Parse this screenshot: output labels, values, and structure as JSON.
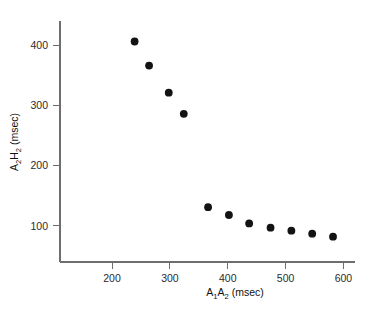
{
  "chart_data": {
    "type": "scatter",
    "title": "",
    "xlabel": "A1A2 (msec)",
    "ylabel": "A2H2 (msec)",
    "xlabel_parts": {
      "a": "A",
      "sub1": "1",
      "b": "A",
      "sub2": "2",
      "unit": " (msec)"
    },
    "ylabel_parts": {
      "a": "A",
      "sub1": "2",
      "b": "H",
      "sub2": "2",
      "unit": " (msec)"
    },
    "xlim": [
      110,
      620
    ],
    "ylim": [
      40,
      440
    ],
    "xticks": [
      200,
      300,
      400,
      500,
      600
    ],
    "xtick_labels": [
      "200",
      "300",
      "400",
      "500",
      "600"
    ],
    "yticks": [
      100,
      200,
      300,
      400
    ],
    "ytick_labels": [
      "100",
      "200",
      "300",
      "400"
    ],
    "grid": false,
    "legend": null,
    "marker": "filled-circle",
    "marker_color": "#131313",
    "marker_size_px": 5.2,
    "x": [
      239,
      264,
      298,
      324,
      366,
      402,
      437,
      474,
      510,
      546,
      582
    ],
    "y": [
      406,
      366,
      321,
      286,
      131,
      118,
      104,
      97,
      92,
      87,
      82
    ],
    "points": [
      {
        "x": 239,
        "y": 406
      },
      {
        "x": 264,
        "y": 366
      },
      {
        "x": 298,
        "y": 321
      },
      {
        "x": 324,
        "y": 286
      },
      {
        "x": 366,
        "y": 131
      },
      {
        "x": 402,
        "y": 118
      },
      {
        "x": 437,
        "y": 104
      },
      {
        "x": 474,
        "y": 97
      },
      {
        "x": 510,
        "y": 92
      },
      {
        "x": 546,
        "y": 87
      },
      {
        "x": 582,
        "y": 82
      }
    ],
    "n_points": 11,
    "axis_color": "#6e6e6e",
    "text_color": "#111111",
    "background": "#ffffff"
  },
  "figure": {
    "name": "a2h2-vs-a1a2-scatter"
  }
}
